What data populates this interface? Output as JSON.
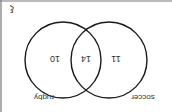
{
  "diagram": {
    "type": "venn",
    "orientation": "rotated 180 degrees",
    "universal_symbol": "ξ",
    "sets": [
      {
        "name": "rugby",
        "only_count": "10"
      },
      {
        "name": "soccer",
        "only_count": "11"
      }
    ],
    "intersection_count": "14",
    "stroke_color": "#1a1a1a",
    "frame_color": "#666666"
  }
}
